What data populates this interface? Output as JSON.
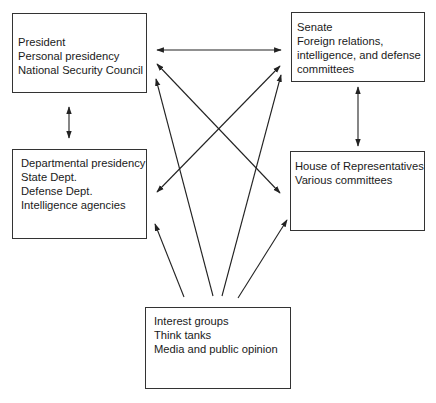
{
  "nodes": {
    "president": {
      "lines": [
        "President",
        "Personal presidency",
        "National Security Council"
      ]
    },
    "senate": {
      "lines": [
        "Senate",
        "Foreign relations,",
        "intelligence, and defense",
        "committees"
      ]
    },
    "departmental": {
      "lines": [
        "Departmental presidency",
        "State Dept.",
        "Defense Dept.",
        "Intelligence agencies"
      ]
    },
    "house": {
      "lines": [
        "House of  Representatives",
        "Various committees"
      ]
    },
    "interest": {
      "lines": [
        "Interest  groups",
        "Think tanks",
        "Media and public opinion"
      ]
    }
  },
  "edges": [
    {
      "from": "president",
      "to": "senate",
      "type": "bidirectional"
    },
    {
      "from": "president",
      "to": "departmental",
      "type": "bidirectional"
    },
    {
      "from": "senate",
      "to": "house",
      "type": "bidirectional"
    },
    {
      "from": "president",
      "to": "house",
      "type": "bidirectional"
    },
    {
      "from": "senate",
      "to": "departmental",
      "type": "bidirectional"
    },
    {
      "from": "interest",
      "to": "departmental",
      "type": "directed"
    },
    {
      "from": "interest",
      "to": "president",
      "type": "directed"
    },
    {
      "from": "interest",
      "to": "senate",
      "type": "directed"
    },
    {
      "from": "interest",
      "to": "house",
      "type": "directed"
    }
  ],
  "colors": {
    "line": "#222222",
    "text": "#1a1a1a",
    "background": "#ffffff"
  }
}
